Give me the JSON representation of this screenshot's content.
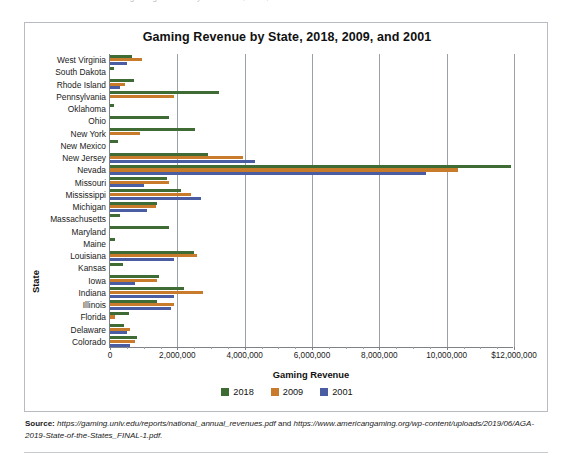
{
  "top_remnant": "— ··· gaming revenue by state 2018, 2009, and 2001 ···",
  "figure": {
    "title": "Gaming Revenue by State, 2018, 2009, and 2001",
    "source_label": "Source:",
    "source_text_1": "https://gaming.unlv.edu/reports/national_annual_revenues.pdf",
    "source_conjunction": " and ",
    "source_text_2": "https://www.americangaming.org/wp-content/uploads/2019/06/AGA-2019-State-of-the-States_FINAL-1.pdf."
  },
  "colors": {
    "series_2018": "#3f6b35",
    "series_2009": "#c97b2c",
    "series_2001": "#4a5da3",
    "axis": "#7d8288",
    "gridline": "#9aa0a6",
    "border": "#b8bcc2"
  },
  "chart_data": {
    "type": "bar",
    "orientation": "horizontal",
    "title": "Gaming Revenue by State, 2018, 2009, and 2001",
    "xlabel": "Gaming Revenue",
    "ylabel": "State",
    "xlim": [
      0,
      12000000
    ],
    "xticks": [
      0,
      2000000,
      4000000,
      6000000,
      8000000,
      10000000,
      12000000
    ],
    "xticklabels": [
      "0",
      "2,000,000",
      "4,000,000",
      "6,000,000",
      "8,000,000",
      "10,000,000",
      "$12,000,000"
    ],
    "grid": true,
    "legend_position": "bottom",
    "categories": [
      "West Virginia",
      "South Dakota",
      "Rhode Island",
      "Pennsylvania",
      "Oklahoma",
      "Ohio",
      "New York",
      "New Mexico",
      "New Jersey",
      "Nevada",
      "Missouri",
      "Mississippi",
      "Michigan",
      "Massachusetts",
      "Maryland",
      "Maine",
      "Louisiana",
      "Kansas",
      "Iowa",
      "Indiana",
      "Illinois",
      "Florida",
      "Delaware",
      "Colorado"
    ],
    "series": [
      {
        "name": "2018",
        "color": "#3f6b35",
        "values": [
          650000,
          106000,
          700000,
          3230000,
          130000,
          1750000,
          2530000,
          250000,
          2900000,
          11900000,
          1700000,
          2120000,
          1400000,
          300000,
          1750000,
          150000,
          2500000,
          400000,
          1450000,
          2200000,
          1400000,
          550000,
          420000,
          810000
        ]
      },
      {
        "name": "2009",
        "color": "#c97b2c",
        "values": [
          950000,
          0,
          450000,
          1900000,
          0,
          0,
          900000,
          0,
          3940000,
          10350000,
          1750000,
          2400000,
          1380000,
          0,
          0,
          0,
          2580000,
          0,
          1400000,
          2750000,
          1900000,
          150000,
          600000,
          750000
        ]
      },
      {
        "name": "2001",
        "color": "#4a5da3",
        "values": [
          500000,
          0,
          300000,
          0,
          0,
          0,
          0,
          0,
          4310000,
          9400000,
          1000000,
          2700000,
          1100000,
          0,
          0,
          0,
          1900000,
          0,
          750000,
          1900000,
          1800000,
          0,
          500000,
          600000
        ]
      }
    ]
  },
  "legend": [
    {
      "label": "2018",
      "color": "#3f6b35"
    },
    {
      "label": "2009",
      "color": "#c97b2c"
    },
    {
      "label": "2001",
      "color": "#4a5da3"
    }
  ]
}
